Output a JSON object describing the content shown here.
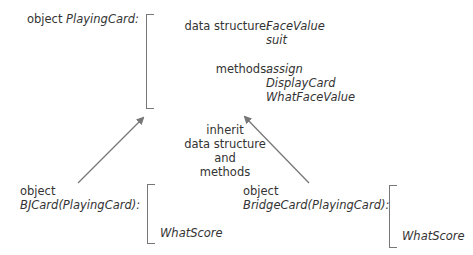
{
  "parent": {
    "label_prefix": "object",
    "name": "PlayingCard:",
    "data_structure_label": "data structure:",
    "data_structure": [
      "FaceValue",
      "suit"
    ],
    "methods_label": "methods:",
    "methods": [
      "assign",
      "DisplayCard",
      "WhatFaceValue"
    ]
  },
  "inherit_note": [
    "inherit",
    "data structure",
    "and",
    "methods"
  ],
  "child_left": {
    "label_prefix": "object",
    "name": "BJCard(PlayingCard):",
    "methods": [
      "WhatScore"
    ]
  },
  "child_right": {
    "label_prefix": "object",
    "name": "BridgeCard(PlayingCard):",
    "methods": [
      "WhatScore"
    ]
  },
  "colors": {
    "line": "#777777",
    "text": "#333333"
  }
}
